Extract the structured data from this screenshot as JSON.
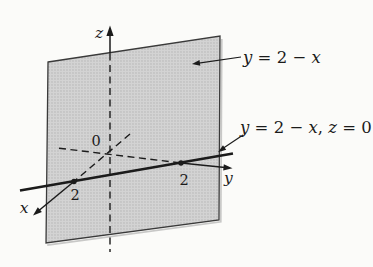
{
  "figure": {
    "type": "3d-plane-diagram",
    "description_labels": {
      "plane_equation": {
        "y_var": "y",
        "mid": " = 2 − ",
        "x_var": "x"
      },
      "trace_equation": {
        "y_var": "y",
        "mid": " = 2 − ",
        "x_var": "x",
        "comma": ", ",
        "z_var": "z",
        "tail": " = 0"
      }
    },
    "axis_labels": {
      "x": "x",
      "y": "y",
      "z": "z"
    },
    "origin_label": "0",
    "x_intercept_label": "2",
    "y_intercept_label": "2",
    "colors": {
      "background": "#fbfbf9",
      "plane_fill": "#d3d3d3",
      "plane_stipple_dot": "#b0b0b0",
      "plane_border": "#3a3a3a",
      "ink": "#1b1b1b",
      "shadow": "#9e9e9e"
    }
  }
}
